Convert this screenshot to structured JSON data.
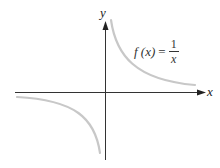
{
  "figure": {
    "type": "function-graph",
    "function_label": {
      "lhs": "f (x)",
      "equals": "=",
      "numerator": "1",
      "denominator": "x"
    },
    "axes": {
      "x_label": "x",
      "y_label": "y"
    },
    "colors": {
      "axis": "#333333",
      "curve": "#c8c8c8",
      "text": "#333333",
      "background": "#ffffff"
    }
  }
}
